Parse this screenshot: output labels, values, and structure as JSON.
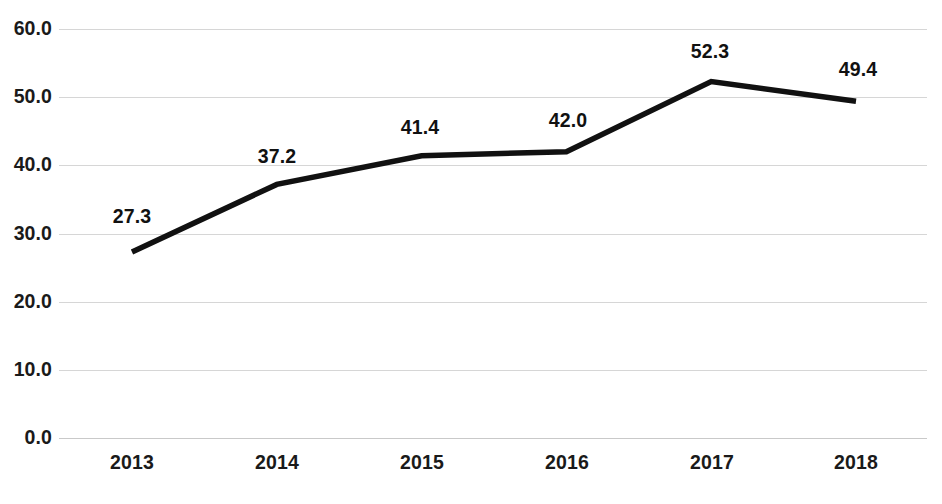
{
  "chart_data": {
    "type": "line",
    "title": "",
    "subtitle": "",
    "xlabel": "",
    "ylabel": "",
    "categories": [
      "2013",
      "2014",
      "2015",
      "2016",
      "2017",
      "2018"
    ],
    "values": [
      27.3,
      37.2,
      41.4,
      42.0,
      52.3,
      49.4
    ],
    "point_labels": [
      "27.3",
      "37.2",
      "41.4",
      "42.0",
      "52.3",
      "49.4"
    ],
    "series": [
      {
        "name": "",
        "values": [
          27.3,
          37.2,
          41.4,
          42.0,
          52.3,
          49.4
        ],
        "color": "#111111",
        "line_width": 5.5,
        "markers": false
      }
    ],
    "ylim": [
      0.0,
      60.0
    ],
    "ytick_values": [
      60.0,
      50.0,
      40.0,
      30.0,
      20.0,
      10.0,
      0.0
    ],
    "ytick_labels": [
      "60.0",
      "50.0",
      "40.0",
      "30.0",
      "20.0",
      "10.0",
      "0.0"
    ],
    "grid": {
      "horizontal": true,
      "vertical": false,
      "color": "#d6d6d6"
    },
    "legend": {
      "visible": false,
      "position": "none",
      "entries": []
    },
    "annotations": [],
    "colors": {
      "background": "#ffffff",
      "line": "#111111",
      "gridline": "#d6d6d6",
      "text": "#1a1a1a"
    }
  }
}
